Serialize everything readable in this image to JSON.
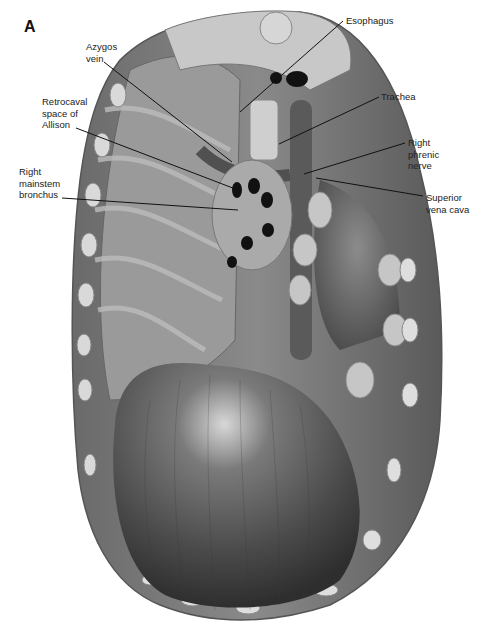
{
  "figure": {
    "panel_letter": "A",
    "labels": [
      {
        "id": "azygos-vein",
        "text": "Azygos\nvein",
        "x": 86,
        "y": 41
      },
      {
        "id": "retrocaval-space",
        "text": "Retrocaval\nspace of\nAllison",
        "x": 42,
        "y": 96
      },
      {
        "id": "right-mainstem-bronchus",
        "text": "Right\nmainstem\nbronchus",
        "x": 19,
        "y": 166
      },
      {
        "id": "esophagus",
        "text": "Esophagus",
        "x": 346,
        "y": 15
      },
      {
        "id": "trachea",
        "text": "Trachea",
        "x": 381,
        "y": 91
      },
      {
        "id": "right-phrenic-nerve",
        "text": "Right\nphrenic\nnerve",
        "x": 408,
        "y": 137
      },
      {
        "id": "superior-vena-cava",
        "text": "Superior\nvena cava",
        "x": 426,
        "y": 192
      }
    ]
  }
}
